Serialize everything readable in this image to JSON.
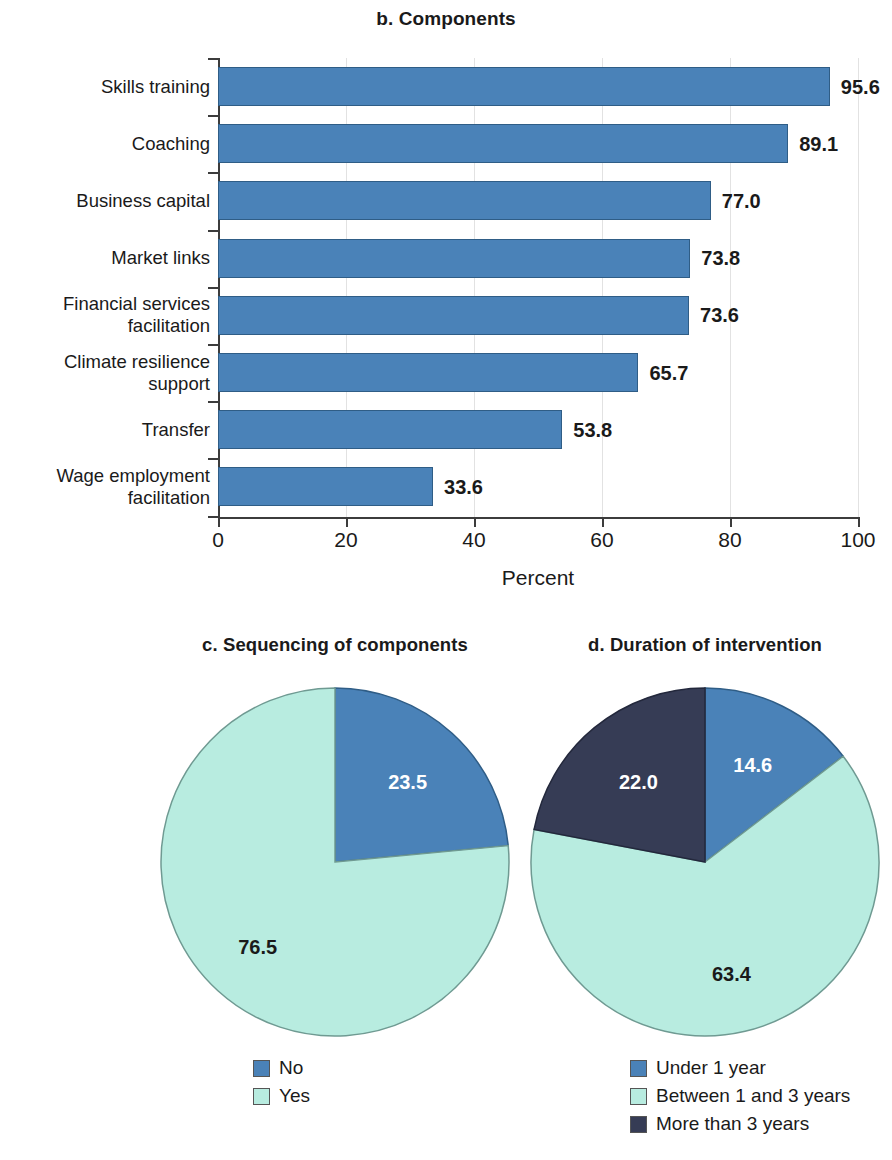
{
  "colors": {
    "blue": "#4a82b8",
    "blue_edge": "#2f5d86",
    "mint": "#b8ece0",
    "mint_edge": "#6f9a92",
    "navy": "#363c55",
    "navy_edge": "#23283c",
    "text": "#1a1a1a",
    "label_on_dark": "#ffffff",
    "axis": "#3c3c3c",
    "grid": "#e2e2e2"
  },
  "chart_data": [
    {
      "type": "bar",
      "orientation": "horizontal",
      "title": "b. Components",
      "xlabel": "Percent",
      "ylabel": "",
      "xlim": [
        0,
        100
      ],
      "xticks": [
        "0",
        "20",
        "40",
        "60",
        "80",
        "100"
      ],
      "grid": true,
      "legend": "none",
      "categories": [
        "Skills training",
        "Coaching",
        "Business capital",
        "Market links",
        "Financial services facilitation",
        "Climate resilience support",
        "Transfer",
        "Wage employment facilitation"
      ],
      "category_lines": [
        [
          "Skills training"
        ],
        [
          "Coaching"
        ],
        [
          "Business capital"
        ],
        [
          "Market links"
        ],
        [
          "Financial services",
          "facilitation"
        ],
        [
          "Climate resilience",
          "support"
        ],
        [
          "Transfer"
        ],
        [
          "Wage employment",
          "facilitation"
        ]
      ],
      "values": [
        95.6,
        89.1,
        77.0,
        73.8,
        73.6,
        65.7,
        53.8,
        33.6
      ],
      "value_labels": [
        "95.6",
        "89.1",
        "77.0",
        "73.8",
        "73.6",
        "65.7",
        "53.8",
        "33.6"
      ],
      "series_color": "#4a82b8"
    },
    {
      "type": "pie",
      "title": "c. Sequencing of components",
      "legend_position": "bottom",
      "labels": [
        "No",
        "Yes"
      ],
      "values": [
        23.5,
        76.5
      ],
      "value_labels": [
        "23.5",
        "76.5"
      ],
      "colors": [
        "#4a82b8",
        "#b8ece0"
      ],
      "label_colors": [
        "#ffffff",
        "#1a1a1a"
      ]
    },
    {
      "type": "pie",
      "title": "d. Duration of intervention",
      "legend_position": "bottom",
      "labels": [
        "Under 1 year",
        "Between 1 and 3 years",
        "More than 3 years"
      ],
      "values": [
        14.6,
        63.4,
        22.0
      ],
      "value_labels": [
        "14.6",
        "63.4",
        "22.0"
      ],
      "colors": [
        "#4a82b8",
        "#b8ece0",
        "#363c55"
      ],
      "label_colors": [
        "#ffffff",
        "#1a1a1a",
        "#ffffff"
      ]
    }
  ],
  "bar": {
    "title": "b. Components",
    "xtitle": "Percent",
    "cats": [
      {
        "lines": [
          "Skills training"
        ],
        "value": 95.6,
        "label": "95.6"
      },
      {
        "lines": [
          "Coaching"
        ],
        "value": 89.1,
        "label": "89.1"
      },
      {
        "lines": [
          "Business capital"
        ],
        "value": 77.0,
        "label": "77.0"
      },
      {
        "lines": [
          "Market links"
        ],
        "value": 73.8,
        "label": "73.8"
      },
      {
        "lines": [
          "Financial services",
          "facilitation"
        ],
        "value": 73.6,
        "label": "73.6"
      },
      {
        "lines": [
          "Climate resilience",
          "support"
        ],
        "value": 65.7,
        "label": "65.7"
      },
      {
        "lines": [
          "Transfer"
        ],
        "value": 53.8,
        "label": "53.8"
      },
      {
        "lines": [
          "Wage employment",
          "facilitation"
        ],
        "value": 33.6,
        "label": "33.6"
      }
    ],
    "xticks": [
      "0",
      "20",
      "40",
      "60",
      "80",
      "100"
    ]
  },
  "pie_c": {
    "title": "c. Sequencing of components",
    "slices": [
      {
        "label": "No",
        "value": 23.5,
        "text": "23.5",
        "color": "#4a82b8",
        "edge": "#2f5d86",
        "textColor": "#ffffff"
      },
      {
        "label": "Yes",
        "value": 76.5,
        "text": "76.5",
        "color": "#b8ece0",
        "edge": "#6f9a92",
        "textColor": "#1a1a1a"
      }
    ]
  },
  "pie_d": {
    "title": "d. Duration of intervention",
    "slices": [
      {
        "label": "Under 1 year",
        "value": 14.6,
        "text": "14.6",
        "color": "#4a82b8",
        "edge": "#2f5d86",
        "textColor": "#ffffff"
      },
      {
        "label": "Between 1 and 3 years",
        "value": 63.4,
        "text": "63.4",
        "color": "#b8ece0",
        "edge": "#6f9a92",
        "textColor": "#1a1a1a"
      },
      {
        "label": "More than 3 years",
        "value": 22.0,
        "text": "22.0",
        "color": "#363c55",
        "edge": "#23283c",
        "textColor": "#ffffff"
      }
    ]
  }
}
